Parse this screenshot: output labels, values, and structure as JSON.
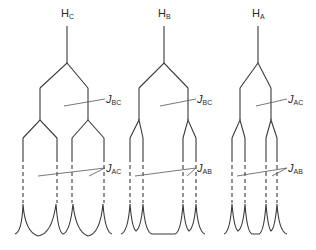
{
  "colors": {
    "line": "#3a3a3a",
    "label": "#2a2a2a",
    "background": "#ffffff"
  },
  "trees": [
    {
      "id": "HC",
      "nucleus": {
        "main": "H",
        "sub": "C"
      },
      "first_coupling": {
        "main": "J",
        "sub": "BC"
      },
      "second_coupling": {
        "main": "J",
        "sub": "AC"
      },
      "peaks": 4
    },
    {
      "id": "HB",
      "nucleus": {
        "main": "H",
        "sub": "B"
      },
      "first_coupling": {
        "main": "J",
        "sub": "BC"
      },
      "second_coupling": {
        "main": "J",
        "sub": "AB"
      },
      "peaks": 4
    },
    {
      "id": "HA",
      "nucleus": {
        "main": "H",
        "sub": "A"
      },
      "first_coupling": {
        "main": "J",
        "sub": "AC"
      },
      "second_coupling": {
        "main": "J",
        "sub": "AB"
      },
      "peaks": 4
    }
  ]
}
